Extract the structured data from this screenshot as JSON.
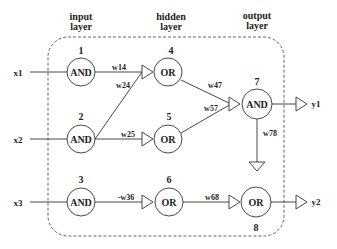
{
  "headers": {
    "input": [
      "input",
      "layer"
    ],
    "hidden": [
      "hidden",
      "layer"
    ],
    "output": [
      "output",
      "layer"
    ]
  },
  "inputs": [
    {
      "label": "x1"
    },
    {
      "label": "x2"
    },
    {
      "label": "x3"
    }
  ],
  "outputs": [
    {
      "label": "y1"
    },
    {
      "label": "y2"
    }
  ],
  "nodes": [
    {
      "id": "1",
      "gate": "AND"
    },
    {
      "id": "2",
      "gate": "AND"
    },
    {
      "id": "3",
      "gate": "AND"
    },
    {
      "id": "4",
      "gate": "OR"
    },
    {
      "id": "5",
      "gate": "OR"
    },
    {
      "id": "6",
      "gate": "OR"
    },
    {
      "id": "7",
      "gate": "AND"
    },
    {
      "id": "8",
      "gate": "OR"
    }
  ],
  "weights": {
    "w14": "w14",
    "w24": "w24",
    "w25": "w25",
    "w36": "-w36",
    "w47": "w47",
    "w57": "w57",
    "w78": "w78",
    "w68": "w68"
  },
  "colors": {
    "stroke": "#333333",
    "dashed": "#555555",
    "text": "#222222"
  }
}
